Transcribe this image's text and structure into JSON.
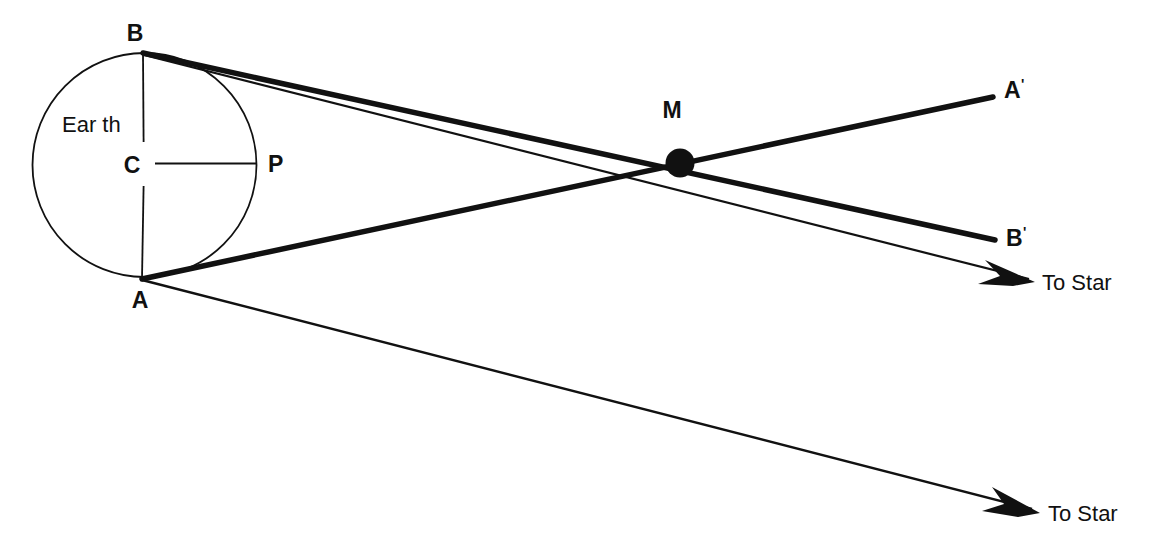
{
  "diagram": {
    "colors": {
      "ink": "#111111",
      "background": "#ffffff"
    },
    "labels": {
      "earth": "Ear th",
      "point_b": "B",
      "point_a": "A",
      "center_c": "C",
      "point_p": "P",
      "point_m": "M",
      "point_a_prime": "A",
      "point_b_prime": "B",
      "prime_mark": "'",
      "to_star_upper": "To  Star",
      "to_star_lower": "To  Star"
    },
    "geometry": {
      "earth_circle": {
        "cx": 144.5,
        "cy": 165,
        "r": 112
      },
      "moon_dot": {
        "cx": 680,
        "cy": 163,
        "r": 14
      },
      "point_b": {
        "x": 143,
        "y": 53
      },
      "point_a": {
        "x": 142,
        "y": 279
      },
      "point_c": {
        "x": 144.5,
        "y": 165
      },
      "point_p": {
        "x": 256,
        "y": 163
      },
      "point_a_prime_end": {
        "x": 993,
        "y": 97
      },
      "point_b_prime_end": {
        "x": 995,
        "y": 240
      },
      "arrow_upper_tip": {
        "x": 1035,
        "y": 282
      },
      "arrow_lower_tip": {
        "x": 1040,
        "y": 513
      }
    }
  }
}
